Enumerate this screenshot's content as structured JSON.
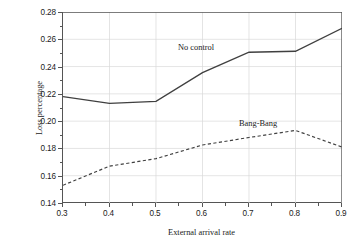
{
  "chart_data": {
    "type": "line",
    "title": "",
    "subtitle": "",
    "xlabel": "External arrival rate",
    "ylabel": "Loss percentage",
    "x": [
      0.3,
      0.4,
      0.5,
      0.6,
      0.7,
      0.8,
      0.9
    ],
    "xticklabels": [
      "0.3",
      "0.4",
      "0.5",
      "0.6",
      "0.7",
      "0.8",
      "0.9"
    ],
    "yticklabels": [
      "0.14",
      "0.16",
      "0.18",
      "0.20",
      "0.22",
      "0.24",
      "0.26",
      "0.28"
    ],
    "yticks": [
      0.14,
      0.16,
      0.18,
      0.2,
      0.22,
      0.24,
      0.26,
      0.28
    ],
    "xlim": [
      0.3,
      0.9
    ],
    "ylim": [
      0.14,
      0.28
    ],
    "grid": true,
    "legend_position": "inline-annotations",
    "series": [
      {
        "name": "No control",
        "style": "solid",
        "color": "#404040",
        "values": [
          0.218,
          0.213,
          0.2145,
          0.2355,
          0.2505,
          0.2512,
          0.268
        ]
      },
      {
        "name": "Bang-Bang",
        "style": "dashed",
        "color": "#404040",
        "values": [
          0.153,
          0.167,
          0.1725,
          0.1825,
          0.188,
          0.1932,
          0.181
        ]
      }
    ],
    "annotations": [
      {
        "text": "No control",
        "x": 0.63,
        "y": 0.2565
      },
      {
        "text": "Bang-Bang",
        "x": 0.795,
        "y": 0.2005
      }
    ]
  }
}
